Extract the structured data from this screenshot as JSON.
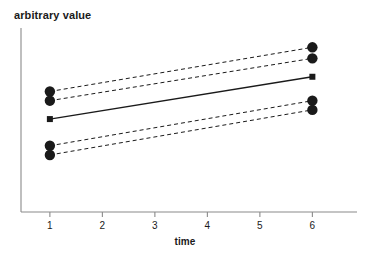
{
  "chart_data": {
    "type": "line",
    "title": "",
    "xlabel": "time",
    "ylabel": "arbitrary value",
    "xlim": [
      0.45,
      6.85
    ],
    "ylim": [
      0,
      10
    ],
    "grid": false,
    "legend": null,
    "x": [
      1,
      6
    ],
    "xticks": [
      1,
      2,
      3,
      4,
      5,
      6
    ],
    "xticklabels": [
      "1",
      "2",
      "3",
      "4",
      "5",
      "6"
    ],
    "yticks": [],
    "yticklabels": [],
    "series": [
      {
        "name": "upper-outer",
        "style": "dashed",
        "marker": "circle",
        "color": "#1a1a1a",
        "values": [
          6.55,
          8.95
        ]
      },
      {
        "name": "upper-inner",
        "style": "dashed",
        "marker": "circle",
        "color": "#1a1a1a",
        "values": [
          6.05,
          8.35
        ]
      },
      {
        "name": "center-solid",
        "style": "solid",
        "marker": "square",
        "color": "#1a1a1a",
        "values": [
          5.05,
          7.35
        ]
      },
      {
        "name": "lower-inner",
        "style": "dashed",
        "marker": "circle",
        "color": "#1a1a1a",
        "values": [
          3.6,
          6.05
        ]
      },
      {
        "name": "lower-outer",
        "style": "dashed",
        "marker": "circle",
        "color": "#1a1a1a",
        "values": [
          3.1,
          5.55
        ]
      }
    ]
  },
  "axes": {
    "x_axis_label": "time",
    "y_axis_label": "arbitrary value",
    "tick_labels": [
      "1",
      "2",
      "3",
      "4",
      "5",
      "6"
    ]
  },
  "colors": {
    "ink": "#1a1a1a",
    "axis": "#8a8a8a",
    "background": "#ffffff"
  }
}
